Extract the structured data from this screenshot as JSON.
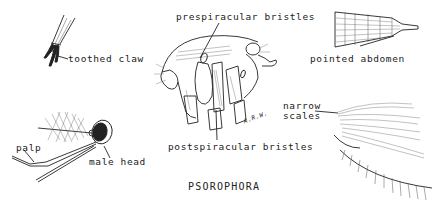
{
  "figure": {
    "title": "PSOROPHORA",
    "colors": {
      "ink": "#222222",
      "background": "#ffffff"
    },
    "panels": [
      {
        "id": "claw",
        "label": "toothed claw"
      },
      {
        "id": "thorax",
        "labels": [
          "prespiracular bristles",
          "postspiracular bristles"
        ],
        "signature": "A.R.W."
      },
      {
        "id": "abdomen",
        "label": "pointed abdomen"
      },
      {
        "id": "head",
        "labels": [
          "palp",
          "male head"
        ]
      },
      {
        "id": "wing",
        "label_lines": [
          "narrow",
          "scales"
        ]
      }
    ]
  }
}
